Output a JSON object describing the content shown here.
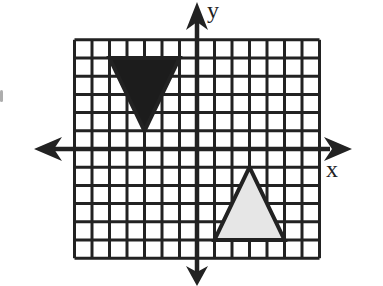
{
  "figure": {
    "type": "coordinate-plane",
    "grid": {
      "x_min": -7,
      "x_max": 7,
      "y_min": -6,
      "y_max": 6,
      "step": 1
    },
    "axes": {
      "x_label": "x",
      "y_label": "y",
      "arrows": true
    },
    "colors": {
      "grid": "#222222",
      "axis": "#222222",
      "dark_fill": "#1c1c1c",
      "light_fill": "#e6e6e6",
      "outline": "#222222"
    },
    "shapes": [
      {
        "name": "dark-triangle",
        "fill": "dark",
        "vertices": [
          [
            -5,
            5
          ],
          [
            -1,
            5
          ],
          [
            -3,
            1
          ]
        ]
      },
      {
        "name": "light-triangle",
        "fill": "light",
        "vertices": [
          [
            1,
            -5
          ],
          [
            5,
            -5
          ],
          [
            3,
            -1
          ]
        ]
      }
    ]
  }
}
